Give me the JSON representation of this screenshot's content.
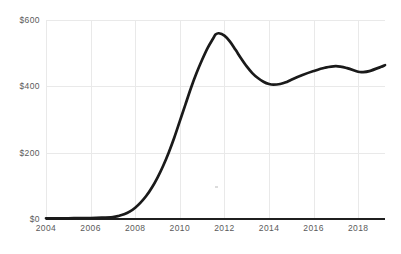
{
  "chart_data": {
    "type": "line",
    "title": "",
    "subtitle": "",
    "xlabel": "",
    "ylabel": "",
    "xlim": [
      2004,
      2019.2
    ],
    "ylim": [
      0,
      600
    ],
    "grid": true,
    "legend": false,
    "legend_position": "none",
    "y_tick_labels": [
      "$600",
      "$400",
      "$200",
      "$0"
    ],
    "y_tick_values": [
      600,
      400,
      200,
      0
    ],
    "x_tick_labels": [
      "2004",
      "2006",
      "2008",
      "2010",
      "2012",
      "2014",
      "2016",
      "2018"
    ],
    "x_tick_values": [
      2004,
      2006,
      2008,
      2010,
      2012,
      2014,
      2016,
      2018
    ],
    "series": [
      {
        "name": "value",
        "color": "#1a1a1a",
        "x": [
          2004,
          2004.5,
          2005,
          2005.5,
          2006,
          2006.5,
          2007,
          2007.25,
          2007.5,
          2007.75,
          2008,
          2008.25,
          2008.5,
          2008.75,
          2009,
          2009.25,
          2009.5,
          2009.75,
          2010,
          2010.25,
          2010.5,
          2010.75,
          2011,
          2011.25,
          2011.5,
          2011.6,
          2011.75,
          2012,
          2012.25,
          2012.5,
          2012.75,
          2013,
          2013.25,
          2013.5,
          2013.75,
          2014,
          2014.2,
          2014.5,
          2014.75,
          2015,
          2015.5,
          2016,
          2016.5,
          2017,
          2017.5,
          2018,
          2018.2,
          2018.5,
          2019,
          2019.2
        ],
        "values": [
          2,
          2,
          2,
          3,
          3,
          4,
          6,
          9,
          14,
          22,
          34,
          50,
          70,
          95,
          125,
          160,
          200,
          245,
          295,
          345,
          395,
          440,
          480,
          516,
          545,
          556,
          560,
          553,
          535,
          510,
          484,
          460,
          440,
          425,
          414,
          407,
          405,
          407,
          412,
          420,
          434,
          446,
          456,
          461,
          455,
          444,
          443,
          446,
          458,
          464
        ]
      }
    ],
    "annotations": []
  },
  "colors": {
    "line": "#1a1a1a",
    "grid": "#e9e9e9",
    "axis": "#1f1f1f",
    "tick_text": "#5a5a5a",
    "background": "#ffffff"
  }
}
